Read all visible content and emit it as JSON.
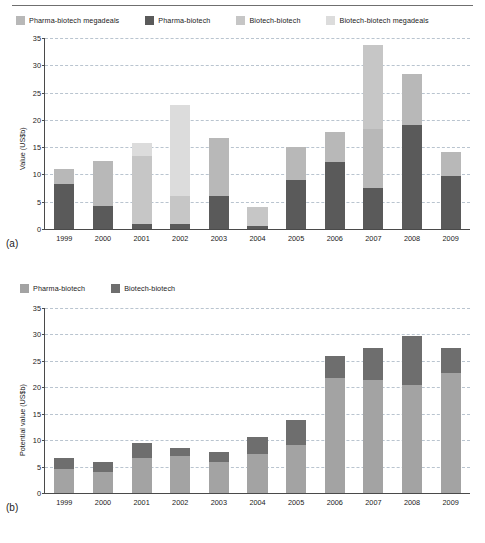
{
  "figure": {
    "panels": [
      {
        "tag": "(a)",
        "ylabel": "Value (US$b)",
        "legend": [
          {
            "label": "Pharma-biotech megadeals",
            "color": "#b8b8b8"
          },
          {
            "label": "Pharma-biotech",
            "color": "#5a5a5a"
          },
          {
            "label": "Biotech-biotech",
            "color": "#c6c6c6"
          },
          {
            "label": "Biotech-biotech megadeals",
            "color": "#dcdcdc"
          }
        ]
      },
      {
        "tag": "(b)",
        "ylabel": "Potential value (US$b)",
        "legend": [
          {
            "label": "Pharma-biotech",
            "color": "#a3a3a3"
          },
          {
            "label": "Biotech-biotech",
            "color": "#6e6e6e"
          }
        ]
      }
    ]
  },
  "chart_data": [
    {
      "type": "bar",
      "stacked": true,
      "panel": "(a)",
      "title": "",
      "xlabel": "",
      "ylabel": "Value (US$b)",
      "ylim": [
        0,
        35
      ],
      "yticks": [
        0,
        5,
        10,
        15,
        20,
        25,
        30,
        35
      ],
      "grid": true,
      "legend_position": "above-plot",
      "categories": [
        "1999",
        "2000",
        "2001",
        "2002",
        "2003",
        "2004",
        "2005",
        "2006",
        "2007",
        "2008",
        "2009"
      ],
      "series": [
        {
          "name": "Pharma-biotech",
          "color": "#5a5a5a",
          "values": [
            8.2,
            4.3,
            0.9,
            1.0,
            6.1,
            0.6,
            9.0,
            12.2,
            7.5,
            19.0,
            9.8
          ]
        },
        {
          "name": "Pharma-biotech megadeals",
          "color": "#b8b8b8",
          "values": [
            2.8,
            8.2,
            0.0,
            0.0,
            10.6,
            0.0,
            6.1,
            5.6,
            10.8,
            9.5,
            4.4
          ]
        },
        {
          "name": "Biotech-biotech",
          "color": "#c6c6c6",
          "values": [
            0.0,
            0.0,
            12.5,
            5.0,
            0.0,
            3.4,
            0.0,
            0.0,
            15.5,
            0.0,
            0.0
          ]
        },
        {
          "name": "Biotech-biotech megadeals",
          "color": "#dcdcdc",
          "values": [
            0.0,
            0.0,
            2.3,
            16.7,
            0.0,
            0.0,
            0.0,
            0.0,
            0.0,
            0.0,
            0.0
          ]
        }
      ],
      "totals": [
        11.0,
        12.5,
        15.7,
        22.7,
        16.7,
        4.0,
        15.1,
        17.8,
        33.8,
        28.5,
        14.2
      ]
    },
    {
      "type": "bar",
      "stacked": true,
      "panel": "(b)",
      "title": "",
      "xlabel": "",
      "ylabel": "Potential value (US$b)",
      "ylim": [
        0,
        35
      ],
      "yticks": [
        0,
        5,
        10,
        15,
        20,
        25,
        30,
        35
      ],
      "grid": true,
      "legend_position": "above-plot",
      "categories": [
        "1999",
        "2000",
        "2001",
        "2002",
        "2003",
        "2004",
        "2005",
        "2006",
        "2007",
        "2008",
        "2009"
      ],
      "series": [
        {
          "name": "Pharma-biotech",
          "color": "#a3a3a3",
          "values": [
            4.5,
            3.9,
            6.7,
            7.0,
            5.8,
            7.4,
            9.0,
            21.7,
            21.3,
            20.5,
            22.8
          ]
        },
        {
          "name": "Biotech-biotech",
          "color": "#6e6e6e",
          "values": [
            2.1,
            2.0,
            2.8,
            1.6,
            2.0,
            3.2,
            4.9,
            4.3,
            6.2,
            9.2,
            4.7
          ]
        }
      ],
      "totals": [
        6.6,
        5.9,
        9.5,
        8.6,
        7.8,
        10.6,
        13.9,
        26.0,
        27.5,
        29.7,
        27.5
      ]
    }
  ]
}
